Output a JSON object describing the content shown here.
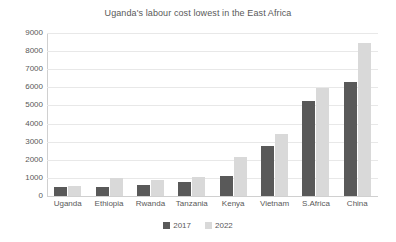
{
  "chart_data": {
    "type": "bar",
    "title": "Uganda's labour cost lowest in the East Africa",
    "xlabel": "",
    "ylabel": "",
    "ylim": [
      0,
      9000
    ],
    "ytick_step": 1000,
    "yticks": [
      "9000",
      "8000",
      "7000",
      "6000",
      "5000",
      "4000",
      "3000",
      "2000",
      "1000",
      "0"
    ],
    "grid": true,
    "legend_position": "bottom",
    "categories": [
      "Uganda",
      "Ethiopia",
      "Rwanda",
      "Tanzania",
      "Kenya",
      "Vietnam",
      "S.Africa",
      "China"
    ],
    "series": [
      {
        "name": "2017",
        "color": "#595959",
        "values": [
          480,
          500,
          590,
          800,
          1090,
          2780,
          5250,
          6320
        ]
      },
      {
        "name": "2022",
        "color": "#d9d9d9",
        "values": [
          580,
          1010,
          860,
          1060,
          2130,
          3400,
          5960,
          8430
        ]
      }
    ]
  },
  "colors": {
    "background": "#ffffff",
    "text": "#595959",
    "gridline": "#e8e8e8",
    "axis": "#d0d0d0",
    "series_2017": "#595959",
    "series_2022": "#d9d9d9"
  }
}
